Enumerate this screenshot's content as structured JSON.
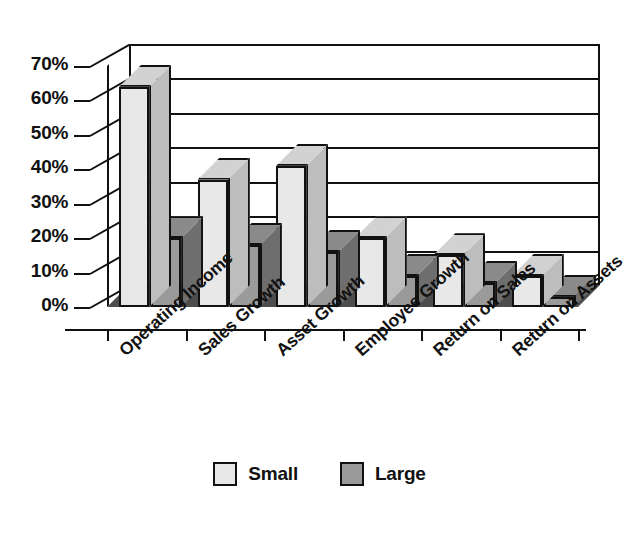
{
  "chart_data": {
    "type": "bar",
    "title": "",
    "subtitle": "",
    "xlabel": "",
    "ylabel": "",
    "categories": [
      "Operating Income",
      "Sales Growth",
      "Asset Growth",
      "Employee Growth",
      "Return on Sales",
      "Return on Assets"
    ],
    "series": [
      {
        "name": "Small",
        "values": [
          64,
          37,
          41,
          20,
          15,
          9
        ],
        "color": "#e8e8e8"
      },
      {
        "name": "Large",
        "values": [
          20,
          18,
          16,
          9,
          7,
          3
        ],
        "color": "#9a9a9a"
      }
    ],
    "ylim": [
      0,
      70
    ],
    "yticks": [
      0,
      10,
      20,
      30,
      40,
      50,
      60,
      70
    ],
    "ytick_labels": [
      "0%",
      "10%",
      "20%",
      "30%",
      "40%",
      "50%",
      "60%",
      "70%"
    ],
    "grid": true,
    "grid_axis": "y",
    "legend_position": "bottom",
    "style": "3d-column",
    "value_suffix": "%"
  },
  "legend": {
    "items": [
      {
        "label": "Small",
        "color": "#e8e8e8"
      },
      {
        "label": "Large",
        "color": "#9a9a9a"
      }
    ]
  },
  "colors": {
    "small_front": "#e8e8e8",
    "small_top": "#d2d2d2",
    "small_side": "#bdbdbd",
    "large_front": "#9a9a9a",
    "large_top": "#8a8a8a",
    "large_side": "#6e6e6e",
    "floor": "#4d4d4d",
    "left_wall": "#d9d9d9",
    "outline": "#111111",
    "background": "#ffffff"
  }
}
